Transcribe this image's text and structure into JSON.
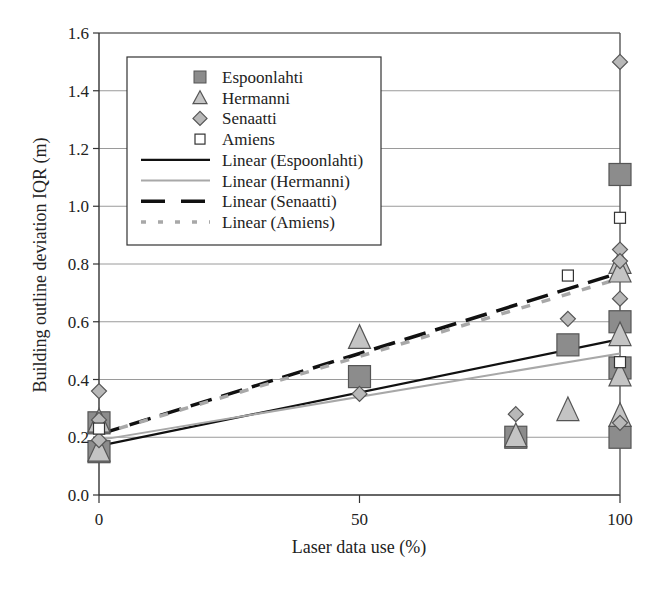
{
  "chart_data": {
    "type": "scatter",
    "title": "",
    "xlabel": "Laser data use (%)",
    "ylabel": "Building outline deviation IQR (m)",
    "xlim": [
      0,
      100
    ],
    "ylim": [
      0.0,
      1.6
    ],
    "xticks": [
      "0",
      "50",
      "100"
    ],
    "yticks": [
      "0.0",
      "0.2",
      "0.4",
      "0.6",
      "0.8",
      "1.0",
      "1.2",
      "1.4",
      "1.6"
    ],
    "grid": "horizontal",
    "legend_position": "upper-left inside",
    "series": [
      {
        "name": "Espoonlahti",
        "marker": "square",
        "color": "#8c8c8c",
        "points": [
          [
            0,
            0.25
          ],
          [
            0,
            0.15
          ],
          [
            50,
            0.41
          ],
          [
            80,
            0.2
          ],
          [
            90,
            0.52
          ],
          [
            100,
            1.11
          ],
          [
            100,
            0.6
          ],
          [
            100,
            0.44
          ],
          [
            100,
            0.2
          ]
        ]
      },
      {
        "name": "Hermanni",
        "marker": "triangle",
        "color": "#c4c4c4",
        "points": [
          [
            0,
            0.25
          ],
          [
            0,
            0.15
          ],
          [
            50,
            0.54
          ],
          [
            80,
            0.2
          ],
          [
            90,
            0.29
          ],
          [
            100,
            0.8
          ],
          [
            100,
            0.77
          ],
          [
            100,
            0.55
          ],
          [
            100,
            0.41
          ],
          [
            100,
            0.27
          ]
        ]
      },
      {
        "name": "Senaatti",
        "marker": "diamond",
        "color": "#b8b8b8",
        "points": [
          [
            0,
            0.36
          ],
          [
            0,
            0.26
          ],
          [
            0,
            0.19
          ],
          [
            50,
            0.35
          ],
          [
            80,
            0.28
          ],
          [
            90,
            0.61
          ],
          [
            100,
            1.5
          ],
          [
            100,
            0.85
          ],
          [
            100,
            0.81
          ],
          [
            100,
            0.68
          ],
          [
            100,
            0.25
          ]
        ]
      },
      {
        "name": "Amiens",
        "marker": "open-square",
        "color": "#ffffff",
        "points": [
          [
            0,
            0.23
          ],
          [
            90,
            0.76
          ],
          [
            100,
            0.96
          ],
          [
            100,
            0.46
          ]
        ]
      }
    ],
    "trendlines": [
      {
        "name": "Linear (Espoonlahti)",
        "style": "solid",
        "color": "#111111",
        "width": 2.2,
        "start": [
          0,
          0.17
        ],
        "end": [
          100,
          0.54
        ]
      },
      {
        "name": "Linear (Hermanni)",
        "style": "solid",
        "color": "#a8a8a8",
        "width": 2,
        "start": [
          0,
          0.19
        ],
        "end": [
          100,
          0.49
        ]
      },
      {
        "name": "Linear (Senaatti)",
        "style": "long-dash",
        "color": "#111111",
        "width": 3.5,
        "start": [
          0,
          0.21
        ],
        "end": [
          100,
          0.77
        ]
      },
      {
        "name": "Linear (Amiens)",
        "style": "short-dash",
        "color": "#a8a8a8",
        "width": 3.5,
        "start": [
          0,
          0.21
        ],
        "end": [
          100,
          0.75
        ]
      }
    ]
  },
  "legend": {
    "items": [
      {
        "label": "Espoonlahti",
        "symbol": "square"
      },
      {
        "label": "Hermanni",
        "symbol": "triangle"
      },
      {
        "label": "Senaatti",
        "symbol": "diamond"
      },
      {
        "label": "Amiens",
        "symbol": "open-square"
      },
      {
        "label": "Linear (Espoonlahti)",
        "symbol": "line-solid-black"
      },
      {
        "label": "Linear (Hermanni)",
        "symbol": "line-solid-gray"
      },
      {
        "label": "Linear (Senaatti)",
        "symbol": "line-dash-black"
      },
      {
        "label": "Linear (Amiens)",
        "symbol": "line-dash-gray"
      }
    ]
  }
}
